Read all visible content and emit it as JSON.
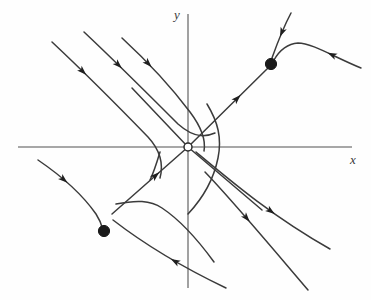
{
  "figure": {
    "kind": "phase-portrait",
    "background_color": "#fefefe",
    "width": 371,
    "height": 300
  },
  "axes": {
    "x_label": "x",
    "y_label": "y",
    "axis_color": "#8a8a8a",
    "axis_width": 1.6,
    "x_axis": {
      "y": 147,
      "x_start": 18,
      "x_end": 352
    },
    "y_axis": {
      "x": 188,
      "y_start": 14,
      "y_end": 288
    },
    "label_color": "#3a3a3a"
  },
  "chart_data": {
    "type": "scatter",
    "title": "",
    "xlabel": "x",
    "ylabel": "y",
    "grid": false,
    "legend": false,
    "origin_px": [
      188,
      147
    ],
    "equilibria": [
      {
        "name": "saddle-origin",
        "marker": "open-circle",
        "x_px": 188,
        "y_px": 147,
        "radius": 4.0,
        "fill": "#ffffff",
        "stroke": "#2b2b2b"
      },
      {
        "name": "stable-node-upper-right",
        "marker": "filled-circle",
        "x_px": 271,
        "y_px": 64,
        "radius": 5.6,
        "fill": "#1a1a1a"
      },
      {
        "name": "stable-node-lower-left",
        "marker": "filled-circle",
        "x_px": 104,
        "y_px": 231,
        "radius": 5.6,
        "fill": "#1a1a1a"
      }
    ],
    "curve_color": "#3b3b3b",
    "curve_width": 1.5,
    "arrow_color": "#1f1f1f",
    "trajectories": [
      {
        "name": "upper-left-outer",
        "path": "M 52,42 C 84,72 116,104 148,137 C 160,150 164,163 160,178",
        "arrows": [
          {
            "t": 0.24,
            "dir": "forward"
          }
        ]
      },
      {
        "name": "upper-left-middle",
        "path": "M 84,32 C 116,62 148,94 178,124 C 196,140 208,136 215,133",
        "arrows": [
          {
            "t": 0.28,
            "dir": "forward"
          }
        ]
      },
      {
        "name": "upper-left-inner",
        "path": "M 122,38 C 148,62 172,88 190,112 C 202,128 206,140 204,151",
        "arrows": [
          {
            "t": 0.26,
            "dir": "forward"
          }
        ]
      },
      {
        "name": "stable-separatrix-upper-left",
        "path": "M 132,88 L 188,147",
        "arrows": []
      },
      {
        "name": "stable-separatrix-lower-left",
        "path": "M 188,147 L 112,214",
        "arrows": [
          {
            "t": 0.42,
            "dir": "backward"
          }
        ]
      },
      {
        "name": "unstable-separatrix-upper-right",
        "path": "M 188,147 L 268,68",
        "arrows": [
          {
            "t": 0.62,
            "dir": "forward"
          }
        ]
      },
      {
        "name": "unstable-separatrix-lower-right",
        "path": "M 188,147 L 262,210",
        "arrows": []
      },
      {
        "name": "incoming-upper-right-node",
        "path": "M 291,13 C 283,28 277,44 272,58",
        "arrows": [
          {
            "t": 0.45,
            "dir": "forward"
          }
        ]
      },
      {
        "name": "right-sweep-into-node",
        "path": "M 361,68 C 334,57 312,43 298,43 C 286,44 278,53 274,60",
        "arrows": [
          {
            "t": 0.33,
            "dir": "forward"
          }
        ]
      },
      {
        "name": "far-left-into-lower-node",
        "path": "M 38,160 C 60,175 82,194 96,214 C 100,220 102,226 103,230",
        "arrows": [
          {
            "t": 0.34,
            "dir": "forward"
          }
        ]
      },
      {
        "name": "hook-right-of-origin",
        "path": "M 207,104 C 218,122 222,138 218,158 C 214,178 203,198 188,214",
        "arrows": []
      },
      {
        "name": "lower-right-outer",
        "path": "M 196,152 C 232,182 272,216 330,249",
        "arrows": [
          {
            "t": 0.58,
            "dir": "forward"
          }
        ]
      },
      {
        "name": "lower-right-inner",
        "path": "M 205,172 C 232,200 262,236 308,290",
        "arrows": [
          {
            "t": 0.4,
            "dir": "forward"
          }
        ]
      },
      {
        "name": "lower-node-outflow",
        "path": "M 113,220 C 144,244 180,266 226,288",
        "arrows": [
          {
            "t": 0.56,
            "dir": "backward"
          }
        ]
      },
      {
        "name": "hook-below-left-node",
        "path": "M 116,204 C 136,200 150,200 162,208 C 180,220 198,240 214,262",
        "arrows": []
      },
      {
        "name": "hook-left-of-origin",
        "path": "M 160,152 C 157,162 154,172 150,180",
        "arrows": []
      }
    ]
  }
}
